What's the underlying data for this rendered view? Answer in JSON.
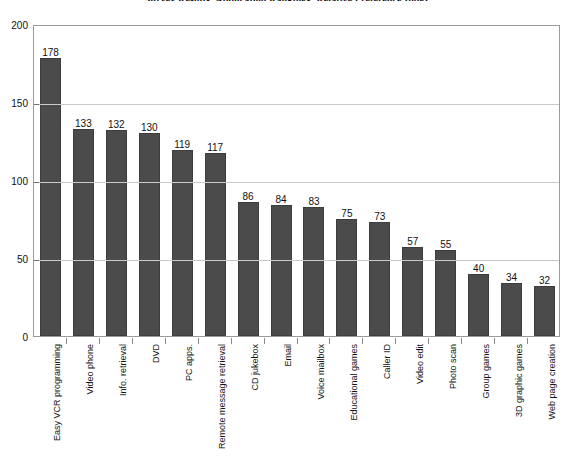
{
  "chart_data": {
    "type": "bar",
    "title": "Survey Results: Application Rankings: Relative Preference Index",
    "xlabel": "",
    "ylabel": "",
    "ylim": [
      0,
      200
    ],
    "yticks": [
      0,
      50,
      100,
      150,
      200
    ],
    "grid": true,
    "legend": null,
    "orientation": "vertical",
    "bar_color": "#4b4b4b",
    "categories": [
      "Easy VCR programming",
      "Video phone",
      "Info. retrieval",
      "DVD",
      "PC apps.",
      "Remote message retrieval",
      "CD jukebox",
      "Email",
      "Voice mailbox",
      "Educational games",
      "Caller ID",
      "Video edit",
      "Photo scan",
      "Group games",
      "3D graphic games",
      "Web page creation"
    ],
    "values": [
      178,
      133,
      132,
      130,
      119,
      117,
      86,
      84,
      83,
      75,
      73,
      57,
      55,
      40,
      34,
      32
    ],
    "data_labels": [
      "178",
      "133",
      "132",
      "130",
      "119",
      "117",
      "86",
      "84",
      "83",
      "75",
      "73",
      "57",
      "55",
      "40",
      "34",
      "32"
    ],
    "ytick_labels": [
      "0",
      "50",
      "100",
      "150",
      "200"
    ]
  }
}
